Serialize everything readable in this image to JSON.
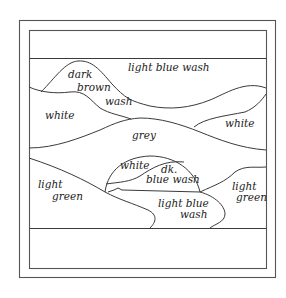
{
  "diagram": {
    "type": "landscape colour-plan sketch",
    "regions": [
      {
        "id": "sky",
        "label": "light blue wash"
      },
      {
        "id": "far-hill",
        "label_lines": [
          "dark",
          "brown",
          "wash"
        ]
      },
      {
        "id": "left-field",
        "label": "white"
      },
      {
        "id": "right-field",
        "label": "white"
      },
      {
        "id": "middle-band",
        "label": "grey"
      },
      {
        "id": "dome-left",
        "label": "white"
      },
      {
        "id": "dome-right",
        "label_lines": [
          "dk.",
          "blue wash"
        ]
      },
      {
        "id": "left-bank",
        "label_lines": [
          "light",
          "green"
        ]
      },
      {
        "id": "river",
        "label_lines": [
          "light blue",
          "wash"
        ]
      },
      {
        "id": "right-bank",
        "label_lines": [
          "light",
          "green"
        ]
      }
    ],
    "labels": {
      "sky": "light blue wash",
      "hill_1": "dark",
      "hill_2": "brown",
      "hill_3": "wash",
      "left_white": "white",
      "right_white": "white",
      "grey": "grey",
      "dome_white": "white",
      "dome_dk": "dk.",
      "dome_blue": "blue wash",
      "left_green_1": "light",
      "left_green_2": "green",
      "river_1": "light blue",
      "river_2": "wash",
      "right_green_1": "light",
      "right_green_2": "green"
    },
    "colors": {
      "line": "#3a3a3a",
      "background": "#ffffff"
    }
  }
}
